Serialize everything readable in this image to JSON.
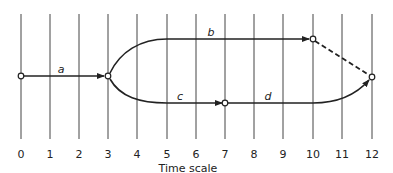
{
  "diagram": {
    "type": "time-scaled network (activity-on-arrow)",
    "axis": {
      "title": "Time scale",
      "ticks": [
        "0",
        "1",
        "2",
        "3",
        "4",
        "5",
        "6",
        "7",
        "8",
        "9",
        "10",
        "11",
        "12"
      ]
    },
    "nodes": [
      {
        "id": "n0",
        "time": 0
      },
      {
        "id": "n3",
        "time": 3
      },
      {
        "id": "n7",
        "time": 7
      },
      {
        "id": "n10",
        "time": 10
      },
      {
        "id": "n12",
        "time": 12
      }
    ],
    "edges": [
      {
        "label": "a",
        "from": "n0",
        "to": "n3",
        "style": "solid"
      },
      {
        "label": "b",
        "from": "n3",
        "to": "n10",
        "style": "solid"
      },
      {
        "label": "c",
        "from": "n3",
        "to": "n7",
        "style": "solid"
      },
      {
        "label": "d",
        "from": "n7",
        "to": "n12",
        "style": "solid"
      },
      {
        "label": "",
        "from": "n10",
        "to": "n12",
        "style": "dashed"
      }
    ],
    "colors": {
      "line": "#222222",
      "grid": "#444444",
      "background": "#ffffff"
    }
  }
}
